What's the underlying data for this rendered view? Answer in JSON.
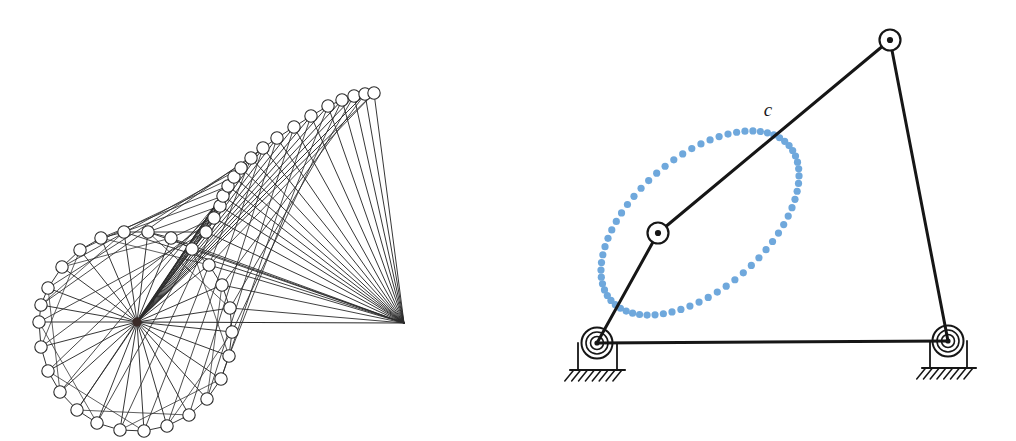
{
  "figure": {
    "background_color": "#ffffff",
    "width": 1016,
    "height": 441,
    "panels": [
      {
        "id": "left-panel",
        "name": "motion-trace-diagram",
        "description": "Superimposed positions of a linkage traced about a central hub",
        "line_color": "#2b2b2b",
        "node_fill": "#ffffff",
        "node_stroke": "#2b2b2b",
        "hub": {
          "x": 137,
          "y": 322,
          "r": 4.5,
          "color": "#3a2b28"
        },
        "apex": {
          "x": 404,
          "y": 323,
          "color": "#2b2b2b"
        },
        "node_radius": 6.2,
        "ring": {
          "center_x": 137,
          "center_y": 322,
          "radius": 98,
          "count": 24,
          "start_angle_deg": 180
        },
        "ring_nodes": [
          {
            "x": 39,
            "y": 322
          },
          {
            "x": 41,
            "y": 347
          },
          {
            "x": 48,
            "y": 371
          },
          {
            "x": 60,
            "y": 392
          },
          {
            "x": 77,
            "y": 410
          },
          {
            "x": 97,
            "y": 423
          },
          {
            "x": 120,
            "y": 430
          },
          {
            "x": 144,
            "y": 431
          },
          {
            "x": 167,
            "y": 426
          },
          {
            "x": 189,
            "y": 415
          },
          {
            "x": 207,
            "y": 399
          },
          {
            "x": 221,
            "y": 379
          },
          {
            "x": 229,
            "y": 356
          },
          {
            "x": 232,
            "y": 332
          },
          {
            "x": 230,
            "y": 308
          },
          {
            "x": 222,
            "y": 285
          },
          {
            "x": 209,
            "y": 265
          },
          {
            "x": 192,
            "y": 249
          },
          {
            "x": 171,
            "y": 238
          },
          {
            "x": 148,
            "y": 232
          },
          {
            "x": 124,
            "y": 232
          },
          {
            "x": 101,
            "y": 238
          },
          {
            "x": 80,
            "y": 250
          },
          {
            "x": 62,
            "y": 267
          },
          {
            "x": 48,
            "y": 288
          },
          {
            "x": 41,
            "y": 305
          }
        ],
        "fan_nodes": [
          {
            "x": 206,
            "y": 232
          },
          {
            "x": 214,
            "y": 218
          },
          {
            "x": 220,
            "y": 206
          },
          {
            "x": 223,
            "y": 196
          },
          {
            "x": 228,
            "y": 186
          },
          {
            "x": 234,
            "y": 177
          },
          {
            "x": 241,
            "y": 168
          },
          {
            "x": 251,
            "y": 158
          },
          {
            "x": 263,
            "y": 148
          },
          {
            "x": 277,
            "y": 138
          },
          {
            "x": 294,
            "y": 127
          },
          {
            "x": 311,
            "y": 116
          },
          {
            "x": 328,
            "y": 106
          },
          {
            "x": 342,
            "y": 100
          },
          {
            "x": 354,
            "y": 96
          },
          {
            "x": 365,
            "y": 94
          },
          {
            "x": 374,
            "y": 93
          }
        ],
        "baseline": {
          "x1": 137,
          "y1": 322,
          "x2": 404,
          "y2": 323
        }
      },
      {
        "id": "right-panel",
        "name": "four-bar-linkage-diagram",
        "description": "Four-bar linkage with coupler point tracing a closed curve",
        "link_color": "#161616",
        "link_width": 3,
        "curve_color": "#6fa8dc",
        "curve_dot_radius": 3.6,
        "curve_dot_count": 68,
        "label": "c",
        "label_x": 768,
        "label_y": 116,
        "joints": {
          "ground_left": {
            "x": 597,
            "y": 343,
            "name": "left-ground-pivot"
          },
          "ground_right": {
            "x": 948,
            "y": 341,
            "name": "right-ground-pivot"
          },
          "top": {
            "x": 890,
            "y": 40,
            "name": "top-pin-joint"
          },
          "coupler_mid": {
            "x": 658,
            "y": 233,
            "name": "coupler-mid-pin-joint"
          },
          "coupler_tip": {
            "x": 890,
            "y": 40,
            "name": "coupler-tip"
          }
        },
        "links": [
          {
            "name": "ground-link",
            "x1": 597,
            "y1": 343,
            "x2": 948,
            "y2": 341
          },
          {
            "name": "crank-link",
            "x1": 597,
            "y1": 343,
            "x2": 658,
            "y2": 233
          },
          {
            "name": "coupler-link",
            "x1": 658,
            "y1": 233,
            "x2": 890,
            "y2": 40
          },
          {
            "name": "rocker-link",
            "x1": 890,
            "y1": 40,
            "x2": 948,
            "y2": 341
          }
        ],
        "coupler_curve": {
          "center_x": 700,
          "center_y": 223,
          "radius_x": 118,
          "radius_y": 66,
          "rotation_deg": -41
        },
        "supports": [
          {
            "name": "left-support",
            "pivot_x": 597,
            "pivot_y": 343,
            "box_x": 578,
            "box_y": 343,
            "box_w": 39,
            "box_h": 27,
            "ground_y": 370,
            "ground_x1": 570,
            "ground_x2": 625,
            "hatch_count": 8
          },
          {
            "name": "right-support",
            "pivot_x": 948,
            "pivot_y": 341,
            "box_x": 930,
            "box_y": 341,
            "box_w": 37,
            "box_h": 27,
            "ground_y": 368,
            "ground_x1": 922,
            "ground_x2": 976,
            "hatch_count": 8
          }
        ]
      }
    ]
  }
}
